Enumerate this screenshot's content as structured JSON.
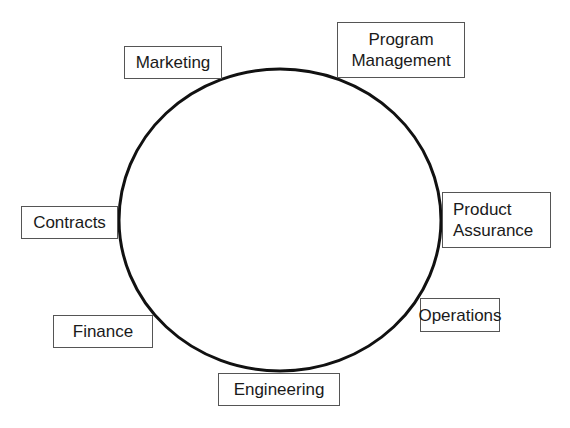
{
  "diagram": {
    "type": "circular-organization",
    "ring": {
      "cx": 280,
      "cy": 220,
      "rx": 161,
      "ry": 151,
      "stroke": "#111111",
      "stroke_width": 3
    },
    "nodes": [
      {
        "id": "marketing",
        "lines": [
          "Marketing"
        ],
        "x": 124,
        "y": 46,
        "w": 98,
        "h": 33
      },
      {
        "id": "program-management",
        "lines": [
          "Program",
          "Management"
        ],
        "x": 337,
        "y": 22,
        "w": 128,
        "h": 56
      },
      {
        "id": "contracts",
        "lines": [
          "Contracts"
        ],
        "x": 21,
        "y": 206,
        "w": 97,
        "h": 33
      },
      {
        "id": "product-assurance",
        "lines": [
          "Product",
          "Assurance"
        ],
        "x": 442,
        "y": 192,
        "w": 109,
        "h": 56
      },
      {
        "id": "operations",
        "lines": [
          "Operations"
        ],
        "x": 420,
        "y": 298,
        "w": 80,
        "h": 34
      },
      {
        "id": "finance",
        "lines": [
          "Finance"
        ],
        "x": 53,
        "y": 315,
        "w": 100,
        "h": 33
      },
      {
        "id": "engineering",
        "lines": [
          "Engineering"
        ],
        "x": 218,
        "y": 373,
        "w": 122,
        "h": 33
      }
    ]
  },
  "labels": {
    "marketing": "Marketing",
    "program_management_1": "Program",
    "program_management_2": "Management",
    "contracts": "Contracts",
    "product_assurance_1": "Product",
    "product_assurance_2": "Assurance",
    "operations": "Operations",
    "finance": "Finance",
    "engineering": "Engineering"
  }
}
